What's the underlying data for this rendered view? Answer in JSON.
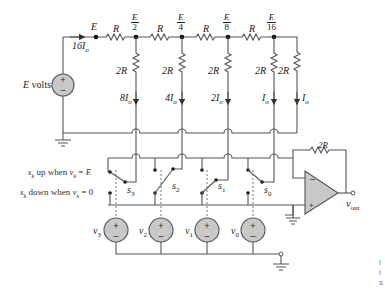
{
  "diagram": {
    "type": "R-2R ladder digital-to-analog converter circuit",
    "source": {
      "label": "E volts",
      "plus": "+",
      "minus": "–"
    },
    "input_current": "16I_o",
    "nodes": [
      {
        "id": "n0",
        "label": "E"
      },
      {
        "id": "n1",
        "num": "E",
        "den": "2"
      },
      {
        "id": "n2",
        "num": "E",
        "den": "4"
      },
      {
        "id": "n3",
        "num": "E",
        "den": "8"
      },
      {
        "id": "n4",
        "num": "E",
        "den": "16"
      }
    ],
    "series_resistors": [
      "R",
      "R",
      "R",
      "R"
    ],
    "shunt_resistors": [
      "2R",
      "2R",
      "2R",
      "2R",
      "2R"
    ],
    "branch_currents": [
      "8I_o",
      "4I_o",
      "2I_o",
      "I_o",
      "I_o"
    ],
    "switches": [
      "s_3",
      "s_2",
      "s_1",
      "s_0"
    ],
    "switch_rules": {
      "up": "s_k up when v_k = E",
      "down": "s_k down when v_k = 0"
    },
    "control_sources": [
      "v_3",
      "v_2",
      "v_1",
      "v_0"
    ],
    "feedback_resistor": "2R",
    "opamp": {
      "minus": "–",
      "plus": "+"
    },
    "output": "v_out",
    "edge_text": [
      "l",
      "i",
      "s"
    ]
  }
}
